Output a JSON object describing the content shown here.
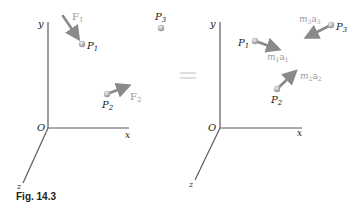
{
  "caption": "Fig. 14.3",
  "equals_sign": "=",
  "colors": {
    "axis": "#5a5a5a",
    "arrow": "#8a8a8a",
    "particle": "#b0b0b0",
    "force_label": "#9a9a9a"
  },
  "left_panel": {
    "axes": {
      "y": "y",
      "x": "x",
      "z": "z",
      "origin": "O"
    },
    "particles": [
      {
        "name": "P",
        "sub": "1"
      },
      {
        "name": "P",
        "sub": "2"
      },
      {
        "name": "P",
        "sub": "3"
      }
    ],
    "forces": [
      {
        "name": "F",
        "sub": "1"
      },
      {
        "name": "F",
        "sub": "2"
      }
    ]
  },
  "right_panel": {
    "axes": {
      "y": "y",
      "x": "x",
      "z": "z",
      "origin": "O"
    },
    "particles": [
      {
        "name": "P",
        "sub": "1"
      },
      {
        "name": "P",
        "sub": "2"
      },
      {
        "name": "P",
        "sub": "3"
      }
    ],
    "effective_forces": [
      {
        "m": "m",
        "msub": "1",
        "a": "a",
        "asub": "1"
      },
      {
        "m": "m",
        "msub": "2",
        "a": "a",
        "asub": "2"
      },
      {
        "m": "m",
        "msub": "3",
        "a": "a",
        "asub": "3"
      }
    ]
  }
}
